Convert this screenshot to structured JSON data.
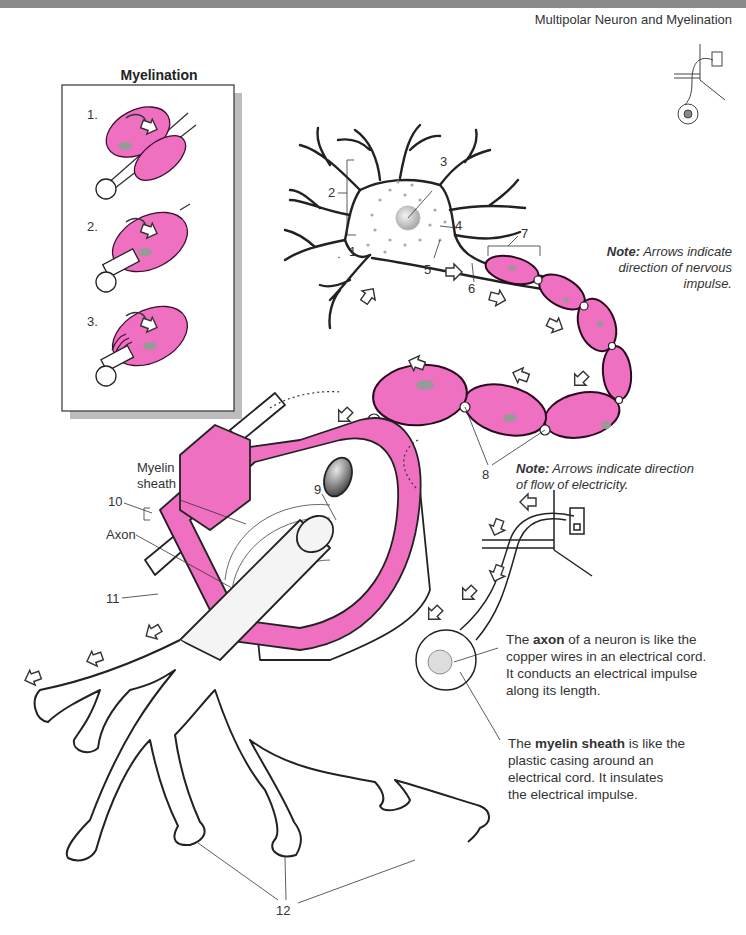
{
  "header": {
    "subtitle": "Multipolar Neuron and Myelination"
  },
  "colors": {
    "myelin_pink": "#ef6fc1",
    "outline": "#222222",
    "header_bar": "#8a8a8a",
    "box_shadow": "#bdbdbd",
    "nucleus_gray": "#bdbdbd"
  },
  "myelination_box": {
    "title": "Myelination",
    "steps": [
      {
        "label": "1."
      },
      {
        "label": "2."
      },
      {
        "label": "3."
      }
    ]
  },
  "neuron_labels": [
    {
      "num": "1"
    },
    {
      "num": "2"
    },
    {
      "num": "3"
    },
    {
      "num": "4"
    },
    {
      "num": "5"
    },
    {
      "num": "6"
    },
    {
      "num": "7"
    },
    {
      "num": "8"
    },
    {
      "num": "9"
    },
    {
      "num": "10"
    },
    {
      "num": "11"
    },
    {
      "num": "12"
    }
  ],
  "text_labels": {
    "myelin_sheath_line1": "Myelin",
    "myelin_sheath_line2": "sheath",
    "axon": "Axon"
  },
  "notes": {
    "nervous": {
      "bold": "Note:",
      "text1": " Arrows indicate",
      "text2": "direction of nervous",
      "text3": "impulse."
    },
    "electricity": {
      "bold": "Note:",
      "text1": " Arrows indicate direction",
      "text2": "of flow of electricity."
    }
  },
  "explanations": {
    "axon": {
      "pre": "The ",
      "bold": "axon",
      "post": " of a neuron is like the",
      "line2": "copper wires in an electrical cord.",
      "line3": "It conducts an electrical impulse",
      "line4": "along its length."
    },
    "myelin": {
      "pre": "The ",
      "bold": "myelin sheath",
      "post": " is like the",
      "line2": "plastic casing around an",
      "line3": "electrical cord. It insulates",
      "line4": "the electrical impulse."
    }
  }
}
